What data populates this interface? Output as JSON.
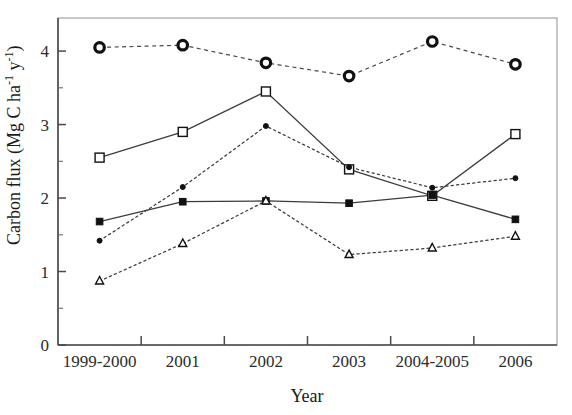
{
  "figure": {
    "title": "",
    "background_color": "#ffffff",
    "ink_color": "#111111"
  },
  "axes": {
    "x_title": "Year",
    "y_title_main": "Carbon flux",
    "y_title_units": "(Mg C ha",
    "y_title_sup1": "-1",
    "y_title_mid": " y",
    "y_title_sup2": "-1",
    "y_title_close": ")",
    "y_ticks": [
      "0",
      "1",
      "2",
      "3",
      "4"
    ],
    "x_ticks": [
      "1999-2000",
      "2001",
      "2002",
      "2003",
      "2004-2005",
      "2006"
    ]
  },
  "chart_data": {
    "type": "line",
    "title": "",
    "xlabel": "Year",
    "ylabel": "Carbon flux (Mg C ha-1 y-1)",
    "categories": [
      "1999-2000",
      "2001",
      "2002",
      "2003",
      "2004-2005",
      "2006"
    ],
    "ylim": [
      0,
      4.45
    ],
    "ytick_values": [
      0,
      1,
      2,
      3,
      4
    ],
    "yminor_values": [
      0.5,
      1.5,
      2.5,
      3.5
    ],
    "grid": false,
    "legend": "none",
    "series": [
      {
        "name": "open-circle",
        "marker": "circle-open",
        "line_style": "dashed",
        "marker_size": 9.5,
        "values": [
          4.05,
          4.08,
          3.84,
          3.66,
          4.13,
          3.82
        ]
      },
      {
        "name": "open-square",
        "marker": "square-open",
        "line_style": "solid",
        "marker_size": 9,
        "values": [
          2.55,
          2.9,
          3.45,
          2.39,
          2.03,
          2.87
        ]
      },
      {
        "name": "filled-circle",
        "marker": "circle-filled",
        "line_style": "dotted",
        "marker_size": 5,
        "values": [
          1.42,
          2.15,
          2.98,
          2.42,
          2.14,
          2.27
        ]
      },
      {
        "name": "filled-square",
        "marker": "square-filled",
        "line_style": "solid",
        "marker_size": 6.6,
        "values": [
          1.68,
          1.95,
          1.96,
          1.93,
          2.04,
          1.71
        ]
      },
      {
        "name": "open-triangle",
        "marker": "triangle-open",
        "line_style": "dotted",
        "marker_size": 8,
        "values": [
          0.87,
          1.38,
          1.96,
          1.23,
          1.32,
          1.48
        ]
      }
    ]
  }
}
